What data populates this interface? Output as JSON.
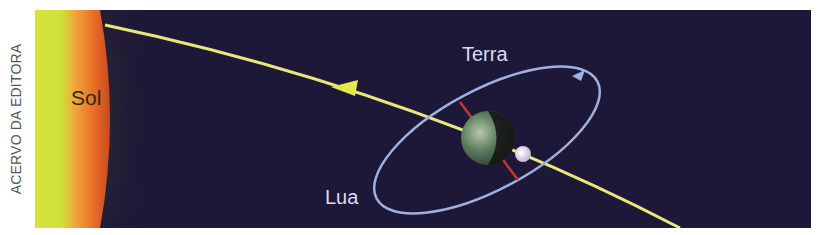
{
  "credit": "ACERVO DA EDITORA",
  "labels": {
    "sun": "Sol",
    "earth": "Terra",
    "moon": "Lua"
  },
  "colors": {
    "space": "#1e1838",
    "sun_core": "#d6e03a",
    "sun_edge": "#f08a2a",
    "earth_path": "#e8e87a",
    "moon_orbit": "#9fb0e0",
    "axis": "#c0392b"
  }
}
